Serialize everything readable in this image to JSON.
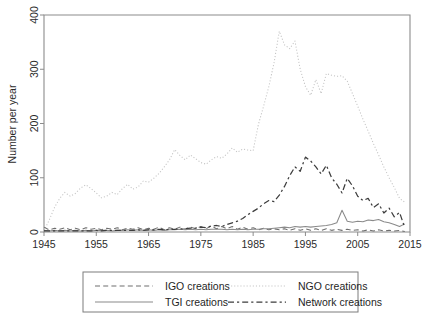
{
  "chart_data": {
    "type": "line",
    "title": "",
    "xlabel": "",
    "ylabel": "Number per year",
    "xlim": [
      1945,
      2015
    ],
    "ylim": [
      0,
      400
    ],
    "xticks": [
      1945,
      1955,
      1965,
      1975,
      1985,
      1995,
      2005,
      2015
    ],
    "yticks": [
      0,
      100,
      200,
      300,
      400
    ],
    "grid": false,
    "legend_position": "below-plot",
    "x": [
      1945,
      1946,
      1947,
      1948,
      1949,
      1950,
      1951,
      1952,
      1953,
      1954,
      1955,
      1956,
      1957,
      1958,
      1959,
      1960,
      1961,
      1962,
      1963,
      1964,
      1965,
      1966,
      1967,
      1968,
      1969,
      1970,
      1971,
      1972,
      1973,
      1974,
      1975,
      1976,
      1977,
      1978,
      1979,
      1980,
      1981,
      1982,
      1983,
      1984,
      1985,
      1986,
      1987,
      1988,
      1989,
      1990,
      1991,
      1992,
      1993,
      1994,
      1995,
      1996,
      1997,
      1998,
      1999,
      2000,
      2001,
      2002,
      2003,
      2004,
      2005,
      2006,
      2007,
      2008,
      2009,
      2010,
      2011,
      2012,
      2013,
      2014
    ],
    "series": [
      {
        "name": "IGO creations",
        "style": "dashed",
        "color": "#6e6e6e",
        "values": [
          9,
          4,
          7,
          5,
          8,
          4,
          7,
          4,
          8,
          5,
          7,
          4,
          7,
          5,
          8,
          4,
          7,
          5,
          8,
          4,
          7,
          5,
          9,
          4,
          8,
          5,
          9,
          5,
          9,
          6,
          10,
          6,
          11,
          6,
          10,
          6,
          10,
          5,
          9,
          5,
          8,
          4,
          7,
          4,
          6,
          4,
          6,
          3,
          6,
          3,
          6,
          3,
          6,
          3,
          6,
          3,
          5,
          3,
          5,
          3,
          4,
          2,
          4,
          2,
          4,
          2,
          3,
          2,
          3,
          1
        ]
      },
      {
        "name": "NGO creations",
        "style": "dotted",
        "color": "#c3c3c3",
        "values": [
          2,
          22,
          45,
          62,
          73,
          66,
          71,
          81,
          87,
          80,
          72,
          63,
          66,
          73,
          69,
          80,
          88,
          79,
          83,
          94,
          92,
          99,
          108,
          120,
          133,
          152,
          141,
          133,
          142,
          135,
          128,
          125,
          133,
          139,
          136,
          144,
          155,
          147,
          153,
          151,
          150,
          198,
          232,
          268,
          312,
          370,
          345,
          338,
          352,
          300,
          268,
          252,
          281,
          255,
          292,
          289,
          287,
          288,
          278,
          255,
          232,
          208,
          186,
          163,
          142,
          120,
          100,
          82,
          62,
          55
        ]
      },
      {
        "name": "TGI creations",
        "style": "solid",
        "color": "#8a8a8a",
        "values": [
          3,
          2,
          3,
          2,
          3,
          2,
          3,
          2,
          3,
          2,
          3,
          3,
          3,
          2,
          3,
          3,
          4,
          3,
          4,
          3,
          4,
          3,
          4,
          3,
          4,
          4,
          5,
          4,
          5,
          4,
          5,
          4,
          5,
          5,
          5,
          4,
          5,
          4,
          5,
          4,
          5,
          5,
          6,
          6,
          7,
          8,
          9,
          8,
          10,
          9,
          10,
          9,
          10,
          11,
          12,
          14,
          17,
          40,
          20,
          18,
          20,
          19,
          22,
          21,
          23,
          19,
          17,
          14,
          10,
          15
        ]
      },
      {
        "name": "Network creations",
        "style": "dash-dot",
        "color": "#3d3d3d",
        "values": [
          2,
          2,
          2,
          2,
          2,
          2,
          2,
          2,
          2,
          2,
          3,
          2,
          3,
          3,
          3,
          3,
          3,
          3,
          4,
          3,
          4,
          4,
          5,
          4,
          5,
          5,
          6,
          6,
          7,
          7,
          9,
          8,
          11,
          12,
          10,
          14,
          17,
          20,
          25,
          32,
          38,
          44,
          52,
          58,
          56,
          68,
          84,
          104,
          120,
          112,
          138,
          131,
          120,
          107,
          123,
          100,
          88,
          72,
          99,
          85,
          66,
          58,
          62,
          45,
          52,
          35,
          44,
          28,
          36,
          8
        ]
      }
    ]
  },
  "legend": {
    "entries": [
      {
        "label": "IGO creations",
        "style": "dashed"
      },
      {
        "label": "NGO creations",
        "style": "dotted"
      },
      {
        "label": "TGI creations",
        "style": "solid"
      },
      {
        "label": "Network creations",
        "style": "dash-dot"
      }
    ]
  },
  "axes": {
    "y_title": "Number per year",
    "y_tick_labels": [
      "0",
      "100",
      "200",
      "300",
      "400"
    ],
    "x_tick_labels": [
      "1945",
      "1955",
      "1965",
      "1975",
      "1985",
      "1995",
      "2005",
      "2015"
    ]
  }
}
